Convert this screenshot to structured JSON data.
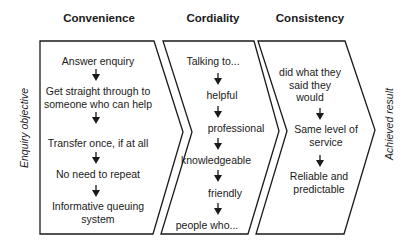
{
  "diagram": {
    "left_label": "Enquiry objective",
    "right_label": "Achieved result",
    "stroke_color": "#1a1a1a",
    "columns": [
      {
        "title": "Convenience",
        "items": [
          "Answer enquiry",
          "Get straight through to\nsomeone who can help",
          "Transfer once, if at all",
          "No need to repeat",
          "Informative queuing\nsystem"
        ]
      },
      {
        "title": "Cordiality",
        "items": [
          "Talking to...",
          "helpful",
          "professional",
          "knowledgeable",
          "friendly",
          "people who..."
        ]
      },
      {
        "title": "Consistency",
        "items": [
          "did what they\nsaid they\nwould",
          "Same level of\nservice",
          "Reliable and\npredictable"
        ]
      }
    ]
  }
}
